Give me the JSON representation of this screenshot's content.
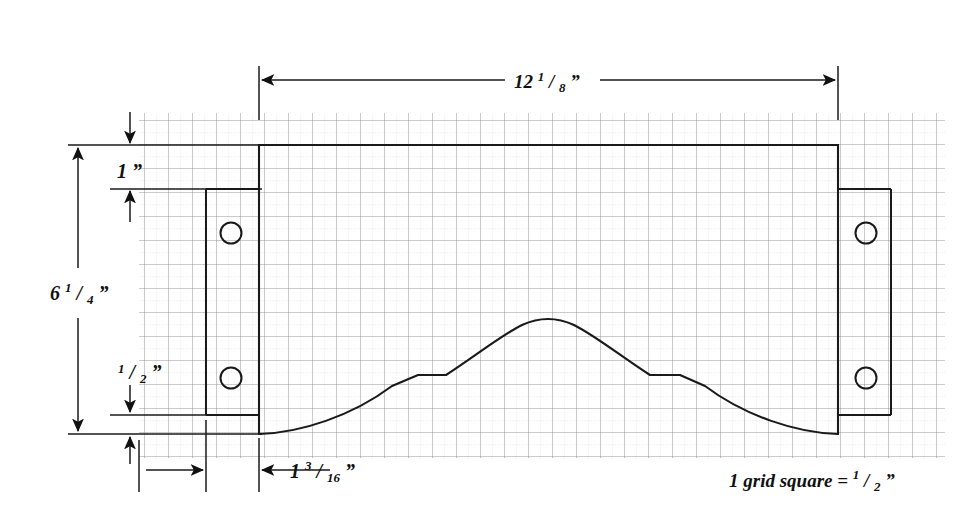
{
  "drawing": {
    "title": "Bracket Plate Technical Drawing",
    "units": "inches",
    "background_color": "#ffffff",
    "line_color": "#1a1a1a",
    "grid_major_color": "#9a9a9a",
    "grid_minor_color": "#bdbdbd",
    "dimensions": {
      "overall_width": {
        "label_whole": "12",
        "label_num": "1",
        "label_den": "8",
        "label_unit": "”",
        "full_text": "12 1/8”",
        "orientation": "horizontal",
        "position": "top"
      },
      "overall_height": {
        "label_whole": "6",
        "label_num": "1",
        "label_den": "4",
        "label_unit": "”",
        "full_text": "6 1/4”",
        "orientation": "vertical",
        "position": "left"
      },
      "top_offset": {
        "label_whole": "1",
        "label_num": "",
        "label_den": "",
        "label_unit": "”",
        "full_text": "1”",
        "orientation": "vertical",
        "position": "upper-left"
      },
      "bottom_offset": {
        "label_whole": "",
        "label_num": "1",
        "label_den": "2",
        "label_unit": "”",
        "full_text": "1/2”",
        "orientation": "vertical",
        "position": "lower-left"
      },
      "bracket_inset": {
        "label_whole": "1",
        "label_num": "3",
        "label_den": "16",
        "label_unit": "”",
        "full_text": "1 3/16”",
        "orientation": "horizontal",
        "position": "bottom"
      }
    },
    "legend": {
      "prefix": "1 grid square = ",
      "num": "1",
      "den": "2",
      "unit": "”",
      "full_text": "1 grid square = 1/2”"
    },
    "features": {
      "main_plate": "rectangular-plate-with-arched-bottom-cutout",
      "left_bracket": "vertical-mounting-flange",
      "right_bracket": "vertical-mounting-flange",
      "hole_count": 4,
      "notch_count": 2,
      "grid_square_value": "1/2”"
    }
  }
}
